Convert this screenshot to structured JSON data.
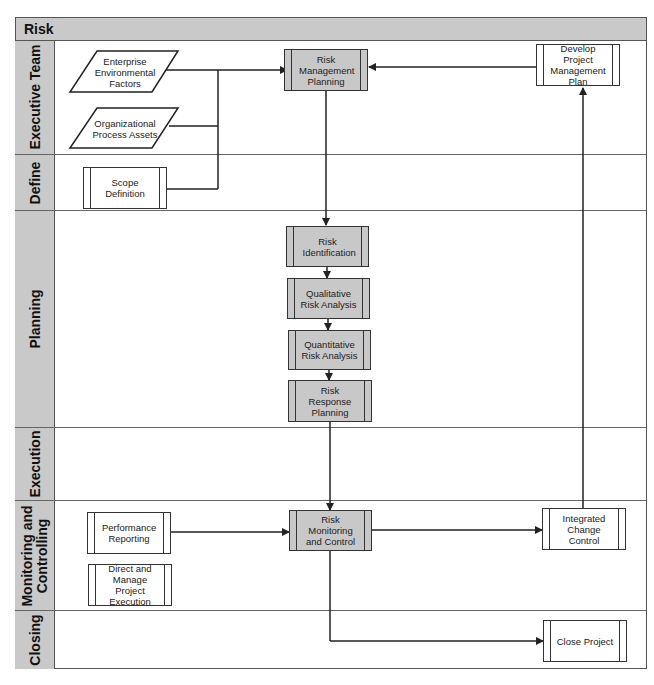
{
  "diagram": {
    "title": "Risk",
    "lanes": [
      {
        "id": "executive-team",
        "label": "Executive Team"
      },
      {
        "id": "define",
        "label": "Define"
      },
      {
        "id": "planning",
        "label": "Planning"
      },
      {
        "id": "execution",
        "label": "Execution"
      },
      {
        "id": "monitoring-controlling",
        "label": "Monitoring and\nControlling",
        "label_line1": "Monitoring and",
        "label_line2": "Controlling"
      },
      {
        "id": "closing",
        "label": "Closing"
      }
    ],
    "inputs": [
      {
        "id": "eef",
        "label": "Enterprise Environmental Factors",
        "shape": "parallelogram",
        "lane": "executive-team"
      },
      {
        "id": "opa",
        "label": "Organizational Process Assets",
        "shape": "parallelogram",
        "lane": "executive-team"
      }
    ],
    "processes": [
      {
        "id": "risk-management-planning",
        "label": "Risk Management Planning",
        "lane": "executive-team",
        "shaded": true
      },
      {
        "id": "develop-project-management-plan",
        "label": "Develop Project Management Plan",
        "lane": "executive-team",
        "shaded": false
      },
      {
        "id": "scope-definition",
        "label": "Scope Definition",
        "lane": "define",
        "shaded": false
      },
      {
        "id": "risk-identification",
        "label": "Risk Identification",
        "lane": "planning",
        "shaded": true
      },
      {
        "id": "qualitative-risk-analysis",
        "label": "Qualitative Risk Analysis",
        "lane": "planning",
        "shaded": true
      },
      {
        "id": "quantitative-risk-analysis",
        "label": "Quantitative Risk Analysis",
        "lane": "planning",
        "shaded": true
      },
      {
        "id": "risk-response-planning",
        "label": "Risk Response Planning",
        "lane": "planning",
        "shaded": true
      },
      {
        "id": "performance-reporting",
        "label": "Performance Reporting",
        "lane": "monitoring-controlling",
        "shaded": false
      },
      {
        "id": "direct-manage-project-execution",
        "label": "Direct and Manage Project Execution",
        "lane": "monitoring-controlling",
        "shaded": false
      },
      {
        "id": "risk-monitoring-control",
        "label": "Risk Monitoring and Control",
        "lane": "monitoring-controlling",
        "shaded": true
      },
      {
        "id": "integrated-change-control",
        "label": "Integrated Change Control",
        "lane": "monitoring-controlling",
        "shaded": false
      },
      {
        "id": "close-project",
        "label": "Close Project",
        "lane": "closing",
        "shaded": false
      }
    ],
    "connections": [
      {
        "from": "eef",
        "to": "risk-management-planning"
      },
      {
        "from": "opa",
        "to": "risk-management-planning"
      },
      {
        "from": "scope-definition",
        "to": "risk-management-planning"
      },
      {
        "from": "develop-project-management-plan",
        "to": "risk-management-planning"
      },
      {
        "from": "risk-management-planning",
        "to": "risk-identification"
      },
      {
        "from": "risk-identification",
        "to": "qualitative-risk-analysis"
      },
      {
        "from": "qualitative-risk-analysis",
        "to": "quantitative-risk-analysis"
      },
      {
        "from": "quantitative-risk-analysis",
        "to": "risk-response-planning"
      },
      {
        "from": "risk-response-planning",
        "to": "risk-monitoring-control"
      },
      {
        "from": "performance-reporting",
        "to": "risk-monitoring-control"
      },
      {
        "from": "risk-monitoring-control",
        "to": "integrated-change-control"
      },
      {
        "from": "integrated-change-control",
        "to": "develop-project-management-plan"
      },
      {
        "from": "risk-monitoring-control",
        "to": "close-project"
      }
    ],
    "colors": {
      "lane_header_fill": "#c9c9c9",
      "shaded_process_fill": "#c8c8c8",
      "stroke": "#333333"
    }
  }
}
